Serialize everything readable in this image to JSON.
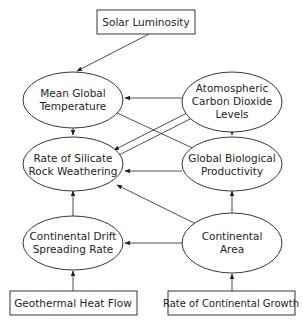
{
  "diagram": {
    "type": "causal-loop",
    "colors": {
      "stroke": "#231f20",
      "background": "#ffffff"
    },
    "nodes": {
      "solar_luminosity": {
        "shape": "box",
        "lines": [
          "Solar Luminosity"
        ]
      },
      "mean_global_temperature": {
        "shape": "ellipse",
        "lines": [
          "Mean Global",
          "Temperature"
        ]
      },
      "atmospheric_co2": {
        "shape": "ellipse",
        "lines": [
          "Atomospheric",
          "Carbon Dioxide",
          "Levels"
        ]
      },
      "silicate_weathering": {
        "shape": "ellipse",
        "lines": [
          "Rate of Silicate",
          "Rock Weathering"
        ]
      },
      "global_bio_productivity": {
        "shape": "ellipse",
        "lines": [
          "Global Biological",
          "Productivity"
        ]
      },
      "continental_drift": {
        "shape": "ellipse",
        "lines": [
          "Continental Drift",
          "Spreading Rate"
        ]
      },
      "continental_area": {
        "shape": "ellipse",
        "lines": [
          "Continental",
          "Area"
        ]
      },
      "geothermal_heat_flow": {
        "shape": "box",
        "lines": [
          "Geothermal Heat Flow"
        ]
      },
      "continental_growth": {
        "shape": "box",
        "lines": [
          "Rate of Continental Growth"
        ]
      }
    },
    "edges": [
      {
        "from": "solar_luminosity",
        "to": "mean_global_temperature",
        "head": "arrow"
      },
      {
        "from": "atmospheric_co2",
        "to": "mean_global_temperature",
        "head": "arrow"
      },
      {
        "from": "mean_global_temperature",
        "to": "silicate_weathering",
        "head": "arrow"
      },
      {
        "from": "mean_global_temperature",
        "to": "global_bio_productivity",
        "head": "dot"
      },
      {
        "from": "atmospheric_co2",
        "to": "silicate_weathering",
        "head": "arrow"
      },
      {
        "from": "silicate_weathering",
        "to": "atmospheric_co2",
        "head": "dot"
      },
      {
        "from": "atmospheric_co2",
        "to": "global_bio_productivity",
        "head": "arrow"
      },
      {
        "from": "global_bio_productivity",
        "to": "silicate_weathering",
        "head": "arrow"
      },
      {
        "from": "continental_drift",
        "to": "silicate_weathering",
        "head": "arrow"
      },
      {
        "from": "continental_area",
        "to": "silicate_weathering",
        "head": "arrow"
      },
      {
        "from": "continental_area",
        "to": "global_bio_productivity",
        "head": "arrow"
      },
      {
        "from": "continental_area",
        "to": "continental_drift",
        "head": "arrow"
      },
      {
        "from": "geothermal_heat_flow",
        "to": "continental_drift",
        "head": "arrow"
      },
      {
        "from": "continental_growth",
        "to": "continental_area",
        "head": "arrow"
      }
    ]
  },
  "labels": {
    "solar_luminosity": "Solar Luminosity",
    "mgt_1": "Mean Global",
    "mgt_2": "Temperature",
    "co2_1": "Atomospheric",
    "co2_2": "Carbon Dioxide",
    "co2_3": "Levels",
    "srw_1": "Rate of Silicate",
    "srw_2": "Rock Weathering",
    "gbp_1": "Global Biological",
    "gbp_2": "Productivity",
    "cd_1": "Continental Drift",
    "cd_2": "Spreading Rate",
    "ca_1": "Continental",
    "ca_2": "Area",
    "geothermal": "Geothermal Heat Flow",
    "growth": "Rate of Continental Growth"
  }
}
